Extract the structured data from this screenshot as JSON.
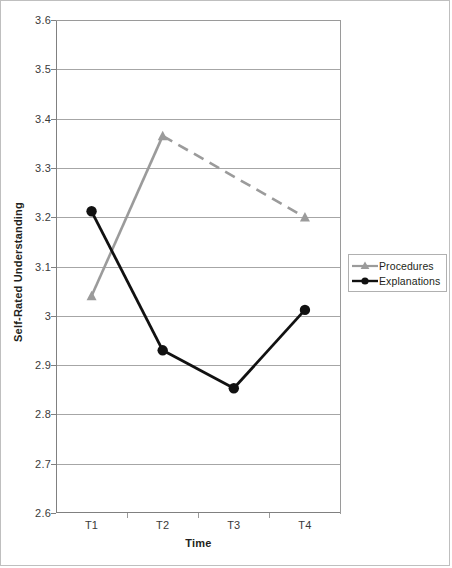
{
  "chart_data": {
    "type": "line",
    "title": "",
    "xlabel": "Time",
    "ylabel": "Self-Rated Understanding",
    "categories": [
      "T1",
      "T2",
      "T3",
      "T4"
    ],
    "ylim": [
      2.6,
      3.6
    ],
    "ytick_labels": [
      "3.6",
      "3.5",
      "3.4",
      "3.3",
      "3.2",
      "3.1",
      "3",
      "2.9",
      "2.8",
      "2.7",
      "2.6"
    ],
    "ytick_values": [
      3.6,
      3.5,
      3.4,
      3.3,
      3.2,
      3.1,
      3.0,
      2.9,
      2.8,
      2.7,
      2.6
    ],
    "grid": true,
    "legend_position": "right",
    "series": [
      {
        "name": "Procedures",
        "color": "#9b9b9b",
        "marker": "triangle",
        "x": [
          "T1",
          "T2",
          "T4"
        ],
        "values": [
          3.04,
          3.365,
          3.2
        ],
        "segments": [
          {
            "from": "T1",
            "to": "T2",
            "style": "solid"
          },
          {
            "from": "T2",
            "to": "T4",
            "style": "dashed"
          }
        ]
      },
      {
        "name": "Explanations",
        "color": "#111111",
        "marker": "circle",
        "x": [
          "T1",
          "T2",
          "T3",
          "T4"
        ],
        "values": [
          3.212,
          2.93,
          2.853,
          3.012
        ],
        "segments": [
          {
            "from": "T1",
            "to": "T2",
            "style": "solid"
          },
          {
            "from": "T2",
            "to": "T3",
            "style": "solid"
          },
          {
            "from": "T3",
            "to": "T4",
            "style": "solid"
          }
        ]
      }
    ]
  },
  "axes": {
    "y_title": "Self-Rated Understanding",
    "x_title": "Time",
    "y_labels": [
      "3.6",
      "3.5",
      "3.4",
      "3.3",
      "3.2",
      "3.1",
      "3",
      "2.9",
      "2.8",
      "2.7",
      "2.6"
    ],
    "x_labels": [
      "T1",
      "T2",
      "T3",
      "T4"
    ]
  },
  "legend": {
    "entries": [
      {
        "label": "Procedures",
        "marker": "triangle-marker-icon",
        "color": "#9b9b9b"
      },
      {
        "label": "Explanations",
        "marker": "circle-marker-icon",
        "color": "#111111"
      }
    ]
  },
  "colors": {
    "procedures": "#9b9b9b",
    "explanations": "#111111",
    "gridline": "#a6a6a6",
    "axis": "#808080",
    "frame": "#bfbfbf",
    "text": "#231f20"
  }
}
